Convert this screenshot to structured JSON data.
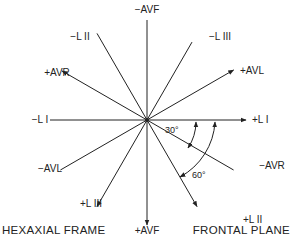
{
  "diagram": {
    "title_left": "HEXAXIAL FRAME",
    "title_right": "FRONTAL PLANE",
    "axes": [
      {
        "name": "lead-i",
        "positive": "+L I",
        "negative": "−L I",
        "positive_angle_deg": 0
      },
      {
        "name": "lead-ii",
        "positive": "+L II",
        "negative": "−L II",
        "positive_angle_deg": 60
      },
      {
        "name": "lead-iii",
        "positive": "+L III",
        "negative": "−L III",
        "positive_angle_deg": 120
      },
      {
        "name": "avr",
        "positive": "+AVR",
        "negative": "−AVR",
        "positive_angle_deg": -150
      },
      {
        "name": "avl",
        "positive": "+AVL",
        "negative": "−AVL",
        "positive_angle_deg": -30
      },
      {
        "name": "avf",
        "positive": "+AVF",
        "negative": "−AVF",
        "positive_angle_deg": 90
      }
    ],
    "angle_annotations": [
      "30°",
      "60°"
    ],
    "colors": {
      "line": "#222222",
      "background": "#ffffff"
    }
  }
}
